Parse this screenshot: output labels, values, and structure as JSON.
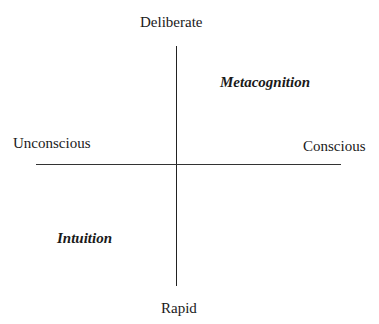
{
  "diagram": {
    "axes": {
      "top": "Deliberate",
      "bottom": "Rapid",
      "left": "Unconscious",
      "right": "Conscious"
    },
    "quadrants": {
      "top_right": "Metacognition",
      "bottom_left": "Intuition"
    }
  }
}
